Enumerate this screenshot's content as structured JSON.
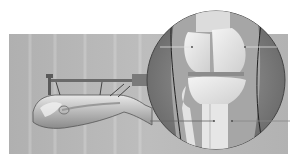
{
  "figure": {
    "background_color": "#ffffff",
    "panel_color": "#b4b4b4",
    "inset_circle": {
      "cx": 216,
      "cy": 80,
      "r": 69
    },
    "leader_lines": [
      {
        "name": "upper-left",
        "x1": 160,
        "y1": 47,
        "x2": 192,
        "y2": 47
      },
      {
        "name": "upper-right",
        "x1": 245,
        "y1": 47,
        "x2": 277,
        "y2": 47
      },
      {
        "name": "lower-left",
        "x1": 150,
        "y1": 121,
        "x2": 214,
        "y2": 121
      },
      {
        "name": "lower-right",
        "x1": 232,
        "y1": 121,
        "x2": 290,
        "y2": 121
      }
    ]
  }
}
